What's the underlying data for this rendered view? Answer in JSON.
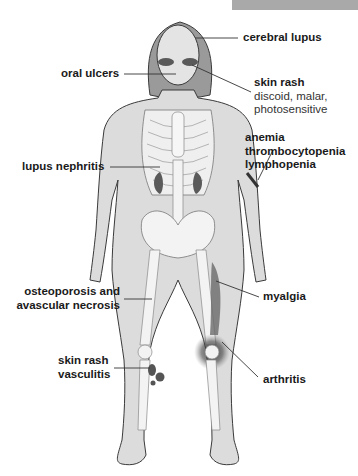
{
  "header_bar": {
    "color": "#a9a9a9"
  },
  "figure": {
    "colors": {
      "skin": "#dcdcdc",
      "hair": "#9a9a9a",
      "bone": "#f3f3f3",
      "outline": "#3a3a3a",
      "lesion": "#5a5a5a"
    }
  },
  "labels": {
    "cerebral_lupus": "cerebral lupus",
    "oral_ulcers": "oral ulcers",
    "skin_rash_face": {
      "title": "skin rash",
      "line1": "discoid, malar,",
      "line2": "photosensitive"
    },
    "blood": {
      "line1": "anemia",
      "line2": "thrombocytopenia",
      "line3": "lymphopenia"
    },
    "lupus_nephritis": "lupus nephritis",
    "osteoporosis": {
      "line1": "osteoporosis and",
      "line2": "avascular necrosis"
    },
    "myalgia": "myalgia",
    "skin_rash_leg": {
      "line1": "skin rash",
      "line2": "vasculitis"
    },
    "arthritis": "arthritis"
  }
}
